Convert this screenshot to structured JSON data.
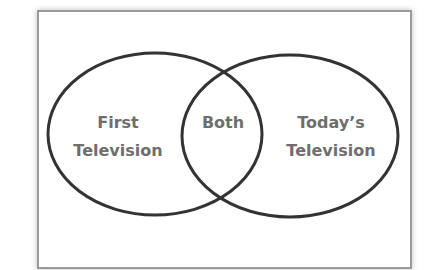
{
  "diagram": {
    "type": "venn",
    "colors": {
      "outline": "#333333",
      "label": "#6e6e6e",
      "frame_border": "#9a9a9a",
      "background": "#ffffff"
    },
    "left_circle": {
      "label_line1": "First",
      "label_line2": "Television"
    },
    "overlap": {
      "label": "Both"
    },
    "right_circle": {
      "label_line1": "Today’s",
      "label_line2": "Television"
    }
  }
}
